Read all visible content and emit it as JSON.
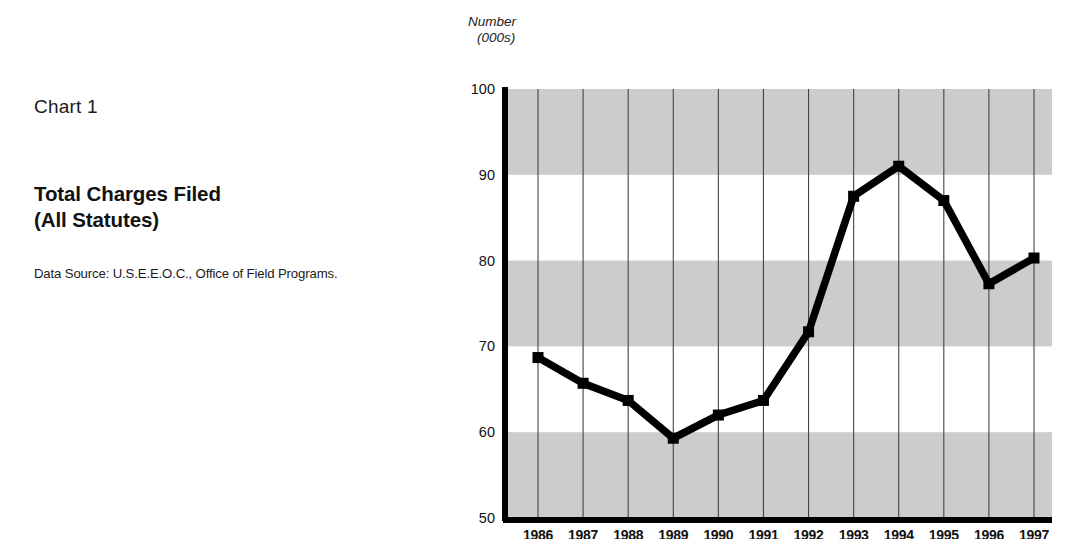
{
  "caption": {
    "chart_number": "Chart 1",
    "title_line1": "Total Charges Filed",
    "title_line2": "(All Statutes)",
    "data_source": "Data Source: U.S.E.E.O.C., Office of Field Programs."
  },
  "axis_title": {
    "line1": "Number",
    "line2": "(000s)"
  },
  "style": {
    "band_color": "#cccccc",
    "line_color": "#000000",
    "grid_color": "#444444",
    "axis_color": "#000000",
    "background": "#ffffff"
  },
  "chart_data": {
    "type": "line",
    "title": "Total Charges Filed (All Statutes)",
    "subtitle": "Chart 1",
    "xlabel": "",
    "ylabel": "Number (000s)",
    "ylim": [
      50,
      100
    ],
    "ytick_values": [
      50,
      60,
      70,
      80,
      90,
      100
    ],
    "ytick_labels": [
      "50",
      "60",
      "70",
      "80",
      "90",
      "100"
    ],
    "grid": "vertical gridlines at each year; horizontal gray bands every 10 units",
    "legend": "none",
    "categories": [
      "1986",
      "1987",
      "1988",
      "1989",
      "1990",
      "1991",
      "1992",
      "1993",
      "1994",
      "1995",
      "1996",
      "1997"
    ],
    "values": [
      68.7,
      65.7,
      63.7,
      59.3,
      62.0,
      63.7,
      71.7,
      87.5,
      91.0,
      87.0,
      77.3,
      80.3
    ],
    "marker": "square",
    "series": [
      {
        "name": "Total Charges Filed (All Statutes)",
        "values": [
          68.7,
          65.7,
          63.7,
          59.3,
          62.0,
          63.7,
          71.7,
          87.5,
          91.0,
          87.0,
          77.3,
          80.3
        ]
      }
    ]
  }
}
